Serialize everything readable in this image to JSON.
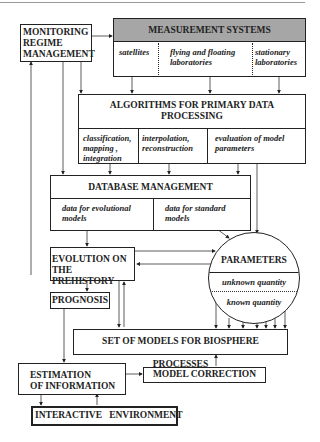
{
  "diagram": {
    "monitoring": {
      "line1": "MONITORING",
      "line2": "REGIME",
      "line3": "MANAGEMENT"
    },
    "measurement": {
      "title": "MEASUREMENT SYSTEMS",
      "header_color": "#a6a6a6",
      "cols": [
        {
          "line1": "satellites",
          "line2": ""
        },
        {
          "line1": "flying  and floating",
          "line2": "laboratories"
        },
        {
          "line1": "stationary",
          "line2": "laboratories"
        }
      ]
    },
    "algorithms": {
      "title_line1": "ALGORITHMS FOR PRIMARY DATA",
      "title_line2": "PROCESSING",
      "cols": [
        {
          "line1": "classification,",
          "line2": "mapping ,",
          "line3": "integration"
        },
        {
          "line1": "interpolation,",
          "line2": "reconstruction",
          "line3": ""
        },
        {
          "line1": "evaluation of model",
          "line2": "parameters",
          "line3": ""
        }
      ]
    },
    "database": {
      "title": "DATABASE  MANAGEMENT",
      "cols": [
        {
          "line1": "data for evolutional",
          "line2": "models"
        },
        {
          "line1": "data for standard",
          "line2": "models"
        }
      ]
    },
    "evolution": {
      "line1": "EVOLUTION  ON",
      "line2": "THE PREHISTORY"
    },
    "parameters": {
      "title": "PARAMETERS",
      "unknown": "unknown quantity",
      "known": "known quantity"
    },
    "prognosis": "PROGNOSIS",
    "models": "SET OF MODELS FOR BIOSPHERE PROCESSES",
    "estimation": {
      "line1": "ESTIMATION",
      "line2": "OF INFORMATION"
    },
    "correction": "MODEL CORRECTION",
    "interactive": "INTERACTIVE   ENVIRONMENT"
  }
}
